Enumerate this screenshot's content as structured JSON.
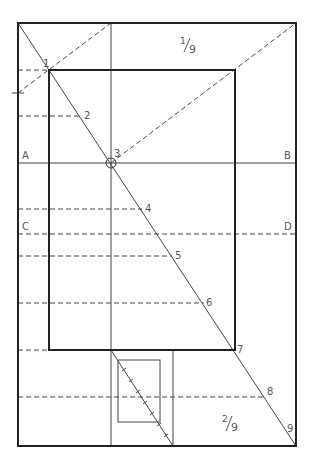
{
  "labels": {
    "p1": "1",
    "p2": "2",
    "p3": "3",
    "p4": "4",
    "p5": "5",
    "p6": "6",
    "p7": "7",
    "p8": "8",
    "p9": "9",
    "A": "A",
    "B": "B",
    "C": "C",
    "D": "D"
  },
  "fractions": {
    "top": {
      "num": "1",
      "den": "9"
    },
    "bottom": {
      "num": "2",
      "den": "9"
    }
  },
  "colors": {
    "stroke": "#222222",
    "thin": "#444444",
    "text": "#555555"
  }
}
